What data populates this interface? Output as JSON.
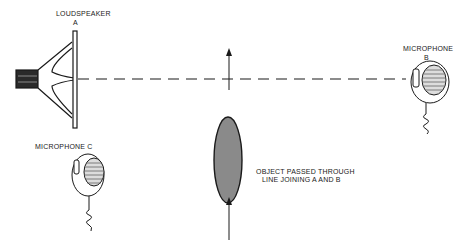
{
  "diagram": {
    "labels": {
      "loudspeaker": "LOUDSPEAKER",
      "loudspeaker_id": "A",
      "microphone_b": "MICROPHONE",
      "microphone_b_id": "B",
      "microphone_c": "MICROPHONE  C",
      "object_line1": "OBJECT PASSED THROUGH",
      "object_line2": "LINE JOINING A AND B"
    },
    "elements": [
      "loudspeaker-icon",
      "microphone-b-icon",
      "microphone-c-icon",
      "object-ellipse",
      "dashed-line-a-b",
      "arrow-up-top",
      "arrow-up-bottom"
    ],
    "colors": {
      "ink": "#1a1a1a",
      "object_fill": "#8a8a8a",
      "background": "#ffffff"
    }
  }
}
